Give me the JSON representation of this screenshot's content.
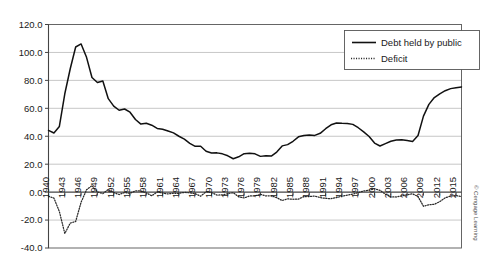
{
  "chart_data": {
    "type": "line",
    "title": "",
    "subtitle": "",
    "xlabel": "",
    "ylabel": "",
    "ylim": [
      -40.0,
      120.0
    ],
    "ytick_step": 20.0,
    "ytick_labels": [
      "120.0",
      "100.0",
      "80.0",
      "60.0",
      "40.0",
      "20.0",
      "0.0",
      "-20.0",
      "-40.0"
    ],
    "ytick_values": [
      120.0,
      100.0,
      80.0,
      60.0,
      40.0,
      20.0,
      0.0,
      -20.0,
      -40.0
    ],
    "grid": true,
    "grid_axis": "y",
    "legend_position": "top-right",
    "xlim": [
      1940,
      2016
    ],
    "xtick_labels": [
      "1940",
      "1943",
      "1946",
      "1949",
      "1952",
      "1955",
      "1958",
      "1961",
      "1964",
      "1967",
      "1970",
      "1973",
      "1976",
      "1979",
      "1982",
      "1985",
      "1988",
      "1991",
      "1994",
      "1997",
      "2000",
      "2003",
      "2006",
      "2009",
      "2012",
      "2015"
    ],
    "xtick_values": [
      1940,
      1943,
      1946,
      1949,
      1952,
      1955,
      1958,
      1961,
      1964,
      1967,
      1970,
      1973,
      1976,
      1979,
      1982,
      1985,
      1988,
      1991,
      1994,
      1997,
      2000,
      2003,
      2006,
      2009,
      2012,
      2015
    ],
    "xtick_rotation": -90,
    "x": [
      1940,
      1941,
      1942,
      1943,
      1944,
      1945,
      1946,
      1947,
      1948,
      1949,
      1950,
      1951,
      1952,
      1953,
      1954,
      1955,
      1956,
      1957,
      1958,
      1959,
      1960,
      1961,
      1962,
      1963,
      1964,
      1965,
      1966,
      1967,
      1968,
      1969,
      1970,
      1971,
      1972,
      1973,
      1974,
      1975,
      1976,
      1977,
      1978,
      1979,
      1980,
      1981,
      1982,
      1983,
      1984,
      1985,
      1986,
      1987,
      1988,
      1989,
      1990,
      1991,
      1992,
      1993,
      1994,
      1995,
      1996,
      1997,
      1998,
      1999,
      2000,
      2001,
      2002,
      2003,
      2004,
      2005,
      2006,
      2007,
      2008,
      2009,
      2010,
      2011,
      2012,
      2013,
      2014,
      2015,
      2016
    ],
    "series": [
      {
        "name": "Debt held by public",
        "style": "solid",
        "color": "#111111",
        "values": [
          44.2,
          42.3,
          47.0,
          70.4,
          88.3,
          103.9,
          106.1,
          96.5,
          82.1,
          78.5,
          79.6,
          66.9,
          61.6,
          58.6,
          59.5,
          57.2,
          52.0,
          48.7,
          49.3,
          47.9,
          45.6,
          45.0,
          43.7,
          42.4,
          40.0,
          37.9,
          34.9,
          32.8,
          32.8,
          29.3,
          28.0,
          28.1,
          27.4,
          26.0,
          23.9,
          25.3,
          27.5,
          27.8,
          27.4,
          25.6,
          26.1,
          25.8,
          28.7,
          33.1,
          34.0,
          36.4,
          39.6,
          40.6,
          40.9,
          40.6,
          42.1,
          45.4,
          48.2,
          49.5,
          49.3,
          49.2,
          48.5,
          46.1,
          43.1,
          39.8,
          35.1,
          33.0,
          34.7,
          36.4,
          37.3,
          37.5,
          36.9,
          36.3,
          40.5,
          54.4,
          62.8,
          67.7,
          70.4,
          72.6,
          74.1,
          74.8,
          75.3
        ]
      },
      {
        "name": "Deficit",
        "style": "dotted",
        "color": "#2b2b2b",
        "values": [
          -3.0,
          -4.3,
          -13.9,
          -29.6,
          -22.2,
          -21.0,
          -7.2,
          1.7,
          4.6,
          0.2,
          -1.1,
          1.9,
          -0.4,
          -1.7,
          -0.3,
          -0.8,
          0.9,
          0.8,
          -0.6,
          -2.6,
          0.1,
          -0.6,
          -1.3,
          -0.8,
          -0.9,
          -0.2,
          -0.5,
          -1.1,
          -2.9,
          0.3,
          -0.3,
          -2.1,
          -2.0,
          -1.1,
          -0.4,
          -3.4,
          -4.2,
          -2.7,
          -2.7,
          -1.6,
          -2.7,
          -2.6,
          -4.0,
          -6.0,
          -4.8,
          -5.1,
          -5.0,
          -3.2,
          -3.1,
          -2.8,
          -3.9,
          -4.5,
          -4.7,
          -3.9,
          -2.9,
          -2.2,
          -1.4,
          -0.3,
          0.8,
          1.4,
          2.4,
          1.3,
          -1.5,
          -3.4,
          -3.5,
          -2.6,
          -1.9,
          -1.2,
          -3.2,
          -10.1,
          -9.0,
          -8.7,
          -6.8,
          -4.1,
          -2.8,
          -2.5,
          -3.2
        ]
      }
    ],
    "legend": [
      {
        "label": "Debt held by public",
        "style": "solid"
      },
      {
        "label": "Deficit",
        "style": "dotted"
      }
    ],
    "credit": "© Cengage Learning"
  }
}
